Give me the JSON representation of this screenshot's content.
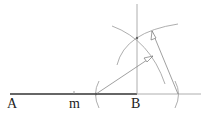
{
  "diagram": {
    "type": "geometric-construction",
    "labels": {
      "A": "A",
      "m": "m",
      "B": "B"
    },
    "colors": {
      "segment": "#666666",
      "line": "#888888",
      "text": "#222222"
    }
  }
}
